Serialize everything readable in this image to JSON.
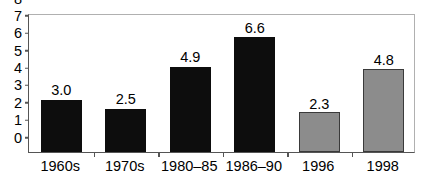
{
  "chart_data": {
    "type": "bar",
    "title": "",
    "subtitle": "",
    "xlabel": "",
    "ylabel": "",
    "categories": [
      "1960s",
      "1970s",
      "1980–85",
      "1986–90",
      "1996",
      "1998"
    ],
    "values": [
      3.0,
      2.5,
      4.9,
      6.6,
      2.3,
      4.8
    ],
    "value_labels": [
      "3.0",
      "2.5",
      "4.9",
      "6.6",
      "2.3",
      "4.8"
    ],
    "bar_styles": [
      "dark",
      "dark",
      "dark",
      "dark",
      "gray",
      "gray"
    ],
    "ylim": [
      0,
      8
    ],
    "ytick_step": 1,
    "ytick_labels": [
      "0",
      "1",
      "2",
      "3",
      "4",
      "5",
      "6",
      "7",
      "8"
    ],
    "grid": false,
    "legend": null,
    "legend_position": "none",
    "annotations": []
  },
  "colors": {
    "bar_dark": "#0d0d0d",
    "bar_gray": "#8c8c8c",
    "bar_gray_outline": "#3a3a3a",
    "axis": "#555555",
    "frame_light": "#b0b0b0",
    "text": "#000000",
    "background": "#ffffff"
  }
}
